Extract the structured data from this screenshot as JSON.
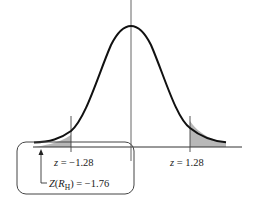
{
  "diagram": {
    "type": "normal-distribution-two-tailed",
    "colors": {
      "curve": "#111111",
      "axis": "#333333",
      "shade": "#b8b8b8",
      "box": "#444444",
      "background": "#ffffff"
    },
    "labels": {
      "left_cutoff": {
        "var": "z",
        "eq": " = ",
        "value": "−1.28"
      },
      "right_cutoff": {
        "var": "z",
        "eq": " = ",
        "value": "1.28"
      },
      "test_stat": {
        "func": "Z",
        "open": "(",
        "var": "R",
        "sub": "H",
        "close": ")",
        "eq": " = ",
        "value": "−1.76"
      }
    }
  }
}
